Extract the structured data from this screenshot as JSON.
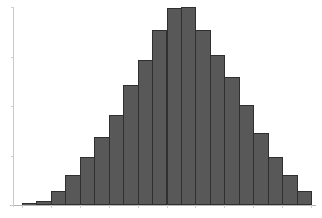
{
  "chart_data": {
    "type": "bar",
    "title": "",
    "subtitle": "",
    "xlabel": "",
    "ylabel": "",
    "grid": false,
    "legend": false,
    "legend_position": "none",
    "orientation": "vertical",
    "distribution_shape": "bell-shaped (approximately normal)",
    "bin_count": 20,
    "axis_color": "#c9c9c9",
    "bar_fill_color": "#585858",
    "bar_edge_color": "#2f2f2f",
    "background_color": "#ffffff",
    "xlim": [
      0,
      20
    ],
    "ylim": [
      0,
      200
    ],
    "categories": [
      "bin-1",
      "bin-2",
      "bin-3",
      "bin-4",
      "bin-5",
      "bin-6",
      "bin-7",
      "bin-8",
      "bin-9",
      "bin-10",
      "bin-11",
      "bin-12",
      "bin-13",
      "bin-14",
      "bin-15",
      "bin-16",
      "bin-17",
      "bin-18",
      "bin-19",
      "bin-20"
    ],
    "x": [
      0,
      1,
      2,
      3,
      4,
      5,
      6,
      7,
      8,
      9,
      10,
      11,
      12,
      13,
      14,
      15,
      16,
      17,
      18,
      19
    ],
    "values": [
      2,
      4,
      14,
      30,
      48,
      68,
      90,
      120,
      145,
      175,
      197,
      198,
      175,
      150,
      128,
      100,
      72,
      48,
      30,
      14
    ],
    "xtick_labels": [],
    "ytick_labels": [],
    "annotations": []
  },
  "chart": {
    "width": 322,
    "height": 218,
    "plot_left": 22,
    "plot_right": 311,
    "baseline_y": 205,
    "plot_top": 7,
    "bar_width": 14.45,
    "max_bar_pixel_height": 198
  }
}
